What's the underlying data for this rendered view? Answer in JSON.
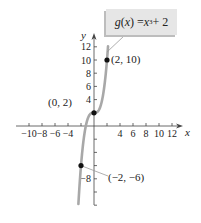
{
  "chart_data": {
    "type": "line",
    "title": "",
    "function_label": {
      "name": "g",
      "var": "x",
      "expr_base": "x",
      "exponent": "3",
      "constant": "+ 2"
    },
    "function": "g(x) = x^3 + 2",
    "xlabel": "x",
    "ylabel": "y",
    "x_ticks": [
      -10,
      -8,
      -6,
      -4,
      -2,
      2,
      4,
      6,
      8,
      10,
      12
    ],
    "x_tick_labels": [
      "−10",
      "−8",
      "−6",
      "−4",
      "4",
      "6",
      "8",
      "10",
      "12"
    ],
    "y_ticks": [
      -12,
      -10,
      -8,
      -6,
      -4,
      -2,
      2,
      4,
      6,
      8,
      10,
      12
    ],
    "y_tick_labels": [
      "12",
      "10",
      "8",
      "6",
      "4",
      "−8"
    ],
    "xlim": [
      -12,
      13
    ],
    "ylim": [
      -14,
      13
    ],
    "grid": false,
    "points": [
      {
        "x": 2,
        "y": 10,
        "label": "(2, 10)"
      },
      {
        "x": 0,
        "y": 2,
        "label": "(0, 2)"
      },
      {
        "x": -2,
        "y": -6,
        "label": "(−2, −6)"
      }
    ],
    "curve_color": "#a8a8a8",
    "point_color": "#111111"
  },
  "labels": {
    "g": "g",
    "x_open": "(",
    "x": "x",
    "x_close": ") = ",
    "x3": "x",
    "exp": "3",
    "plus": " + 2"
  }
}
